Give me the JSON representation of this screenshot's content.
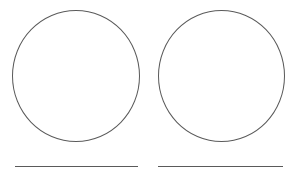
{
  "page": {
    "title": "",
    "background_color": "#ffffff",
    "stroke_color": "#5a5a5a",
    "width": 300,
    "height": 180
  },
  "panels": [
    {
      "id": "left",
      "circle": {
        "name": "circle-outline",
        "label": "",
        "fill": "none",
        "stroke_color": "#5a5a5a",
        "stroke_width": 1
      },
      "rule": {
        "name": "answer-rule",
        "label": "",
        "stroke_color": "#5a5a5a",
        "stroke_width": 1
      }
    },
    {
      "id": "right",
      "circle": {
        "name": "circle-outline",
        "label": "",
        "fill": "none",
        "stroke_color": "#5a5a5a",
        "stroke_width": 1
      },
      "rule": {
        "name": "answer-rule",
        "label": "",
        "stroke_color": "#5a5a5a",
        "stroke_width": 1
      }
    }
  ]
}
